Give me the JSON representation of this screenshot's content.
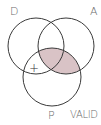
{
  "diagram": {
    "type": "venn-syllogism",
    "labels": {
      "d": "D",
      "a": "A",
      "p": "P"
    },
    "verdict": "VALID",
    "marker": "+",
    "colors": {
      "stroke": "#3a3a3a",
      "shade": "#d9c3c6",
      "label": "#6b6b6b"
    },
    "circles": [
      {
        "name": "D",
        "cx": 36,
        "cy": 46,
        "r": 28
      },
      {
        "name": "A",
        "cx": 66,
        "cy": 46,
        "r": 28
      },
      {
        "name": "P",
        "cx": 52,
        "cy": 77,
        "r": 29
      }
    ],
    "shaded_region": "A ∩ P",
    "marked_region": "D ∩ P (outside A)"
  }
}
